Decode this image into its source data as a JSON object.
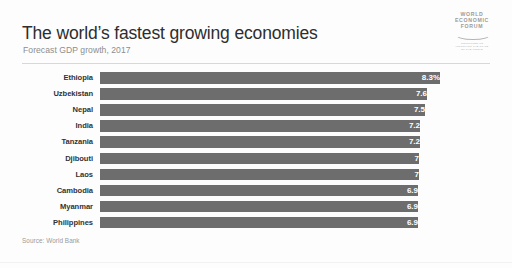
{
  "header": {
    "title": "The world’s fastest growing economies",
    "subtitle": "Forecast GDP growth, 2017"
  },
  "logo": {
    "line1": "WORLD",
    "line2": "ECONOMIC",
    "line3": "FORUM",
    "tagline1": "COMMITTED TO",
    "tagline2": "IMPROVING THE STATE",
    "tagline3": "OF THE WORLD"
  },
  "footer": {
    "source": "Source: World Bank"
  },
  "colors": {
    "bar": "#6d6d6d",
    "value_label": "#ffffff",
    "category_label": "#333333",
    "subtitle": "#8d8d8d",
    "rule": "#d8d8d8",
    "background": "#fdfdfd"
  },
  "chart_data": {
    "type": "bar",
    "orientation": "horizontal",
    "title": "The world’s fastest growing economies",
    "subtitle": "Forecast GDP growth, 2017",
    "xlabel": "",
    "ylabel": "",
    "grid": false,
    "legend": false,
    "axis_visible": false,
    "xlim": [
      0,
      8.8
    ],
    "unit": "percent",
    "categories": [
      "Ethiopia",
      "Uzbekistan",
      "Nepal",
      "India",
      "Tanzania",
      "Djibouti",
      "Laos",
      "Cambodia",
      "Myanmar",
      "Philippines"
    ],
    "values": [
      8.3,
      7.6,
      7.5,
      7.2,
      7.2,
      7,
      7,
      6.9,
      6.9,
      6.9
    ],
    "data_labels": [
      "8.3%",
      "7.6",
      "7.5",
      "7.2",
      "7.2",
      "7",
      "7",
      "6.9",
      "6.9",
      "6.9"
    ],
    "bar_pixel_widths": [
      340,
      327,
      325,
      320,
      320,
      319,
      319,
      318,
      318,
      318
    ],
    "source": "Source: World Bank"
  }
}
